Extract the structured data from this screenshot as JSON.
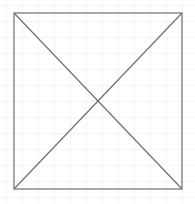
{
  "diagram": {
    "type": "rectangle-with-diagonals",
    "background": {
      "color": "#ffffff",
      "grid_color": "#f4f4f4",
      "grid_size": 16
    },
    "rectangle": {
      "x": 14,
      "y": 13,
      "width": 168,
      "height": 176,
      "stroke": "#6f6f6f",
      "stroke_width": 1.2,
      "fill": "none"
    },
    "diagonals": [
      {
        "x1": 14,
        "y1": 13,
        "x2": 182,
        "y2": 189
      },
      {
        "x1": 182,
        "y1": 13,
        "x2": 14,
        "y2": 189
      }
    ],
    "intersection": {
      "x": 98,
      "y": 101
    }
  }
}
